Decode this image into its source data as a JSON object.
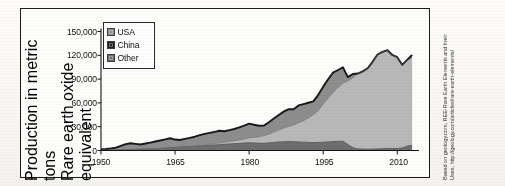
{
  "figure": {
    "frame_border_color": "#1b1b1b",
    "background_color": "#fdfdfb",
    "page_background": "#fbfaf7"
  },
  "axes": {
    "y_title_line1": "Production in metric tons",
    "y_title_line2": "Rare earth oxide equivalent",
    "y_ticks": [
      "0",
      "30,000",
      "60,000",
      "90,000",
      "120,000",
      "150,000"
    ],
    "x_ticks": [
      "1950",
      "1965",
      "1980",
      "1995",
      "2010"
    ]
  },
  "legend": {
    "items": [
      {
        "label": "USA",
        "color": "#8d8d8d",
        "swatch_name": "legend-swatch-usa"
      },
      {
        "label": "China",
        "color": "#1d1d1d",
        "swatch_name": "legend-swatch-china"
      },
      {
        "label": "Other",
        "color": "#6e6e6e",
        "swatch_name": "legend-swatch-other"
      }
    ]
  },
  "attribution": {
    "line1": "Based on geology.com, REE-Rare Earth Elements and their",
    "line2": "Uses, http://geology.com/articles/rare-earth-elements/"
  },
  "chart_data": {
    "type": "area",
    "stacked": true,
    "title": "",
    "xlabel": "",
    "ylabel": "Production in metric tons Rare earth oxide equivalent",
    "xlim": [
      1950,
      2014
    ],
    "ylim": [
      0,
      150000
    ],
    "yticks": [
      0,
      30000,
      60000,
      90000,
      120000,
      150000
    ],
    "xticks": [
      1950,
      1965,
      1980,
      1995,
      2010
    ],
    "grid": false,
    "legend_position": "upper-left-inside",
    "x": [
      1950,
      1951,
      1952,
      1953,
      1954,
      1955,
      1956,
      1957,
      1958,
      1959,
      1960,
      1961,
      1962,
      1963,
      1964,
      1965,
      1966,
      1967,
      1968,
      1969,
      1970,
      1971,
      1972,
      1973,
      1974,
      1975,
      1976,
      1977,
      1978,
      1979,
      1980,
      1981,
      1982,
      1983,
      1984,
      1985,
      1986,
      1987,
      1988,
      1989,
      1990,
      1991,
      1992,
      1993,
      1994,
      1995,
      1996,
      1997,
      1998,
      1999,
      2000,
      2001,
      2002,
      2003,
      2004,
      2005,
      2006,
      2007,
      2008,
      2009,
      2010,
      2011,
      2012,
      2013
    ],
    "series": [
      {
        "name": "Other",
        "color": "#6e6e6e",
        "values": [
          300,
          400,
          500,
          600,
          800,
          1000,
          1200,
          1400,
          1600,
          1800,
          2000,
          2300,
          2600,
          3000,
          3400,
          3800,
          4200,
          4600,
          5000,
          5400,
          5800,
          6200,
          6600,
          7000,
          7400,
          7800,
          8200,
          8600,
          9000,
          9400,
          9800,
          9500,
          9200,
          9000,
          9600,
          10200,
          10800,
          11000,
          11200,
          11000,
          10800,
          10500,
          10200,
          10000,
          10200,
          10500,
          10800,
          11200,
          11500,
          11800,
          7500,
          3500,
          2000,
          1800,
          1700,
          1800,
          2000,
          2300,
          2600,
          2400,
          2600,
          3000,
          5500,
          6500
        ]
      },
      {
        "name": "China",
        "color": "#b8b8b8",
        "values": [
          0,
          0,
          0,
          0,
          0,
          0,
          0,
          0,
          0,
          0,
          0,
          0,
          0,
          0,
          0,
          0,
          0,
          0,
          0,
          0,
          500,
          800,
          1100,
          1500,
          2000,
          2500,
          3000,
          3500,
          4200,
          5000,
          6000,
          7000,
          8000,
          9500,
          11000,
          13000,
          15000,
          17000,
          19000,
          21000,
          24000,
          27000,
          31000,
          35000,
          40000,
          48000,
          55000,
          62000,
          68000,
          73000,
          80000,
          88000,
          95000,
          98000,
          102000,
          110000,
          119000,
          122000,
          124000,
          118000,
          115000,
          105000,
          108000,
          110000
        ]
      },
      {
        "name": "USA",
        "color": "#8d8d8d",
        "values": [
          1200,
          1500,
          2000,
          3000,
          5000,
          7000,
          8000,
          7000,
          6000,
          7000,
          8000,
          9000,
          10000,
          11000,
          12000,
          10000,
          9000,
          10000,
          11000,
          12000,
          13000,
          14000,
          14500,
          15000,
          15500,
          14000,
          14500,
          15000,
          16000,
          17000,
          18000,
          16000,
          14000,
          13000,
          15000,
          17000,
          19000,
          21000,
          22000,
          20000,
          22000,
          21000,
          19000,
          17000,
          20000,
          22000,
          24000,
          25000,
          22000,
          20000,
          5000,
          5000,
          0,
          0,
          0,
          0,
          0,
          0,
          0,
          0,
          0,
          0,
          800,
          4000
        ]
      }
    ]
  }
}
